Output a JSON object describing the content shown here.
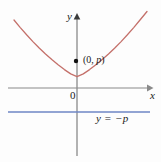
{
  "figure": {
    "background_color": "#fdfdfd",
    "width": 161,
    "height": 162
  },
  "axes": {
    "x_label": "x",
    "y_label": "y",
    "origin_label": "0",
    "axis_color": "#8a8a8a",
    "x_axis": {
      "y_px": 88,
      "x_start_px": 8,
      "x_end_px": 152
    },
    "y_axis": {
      "x_px": 77,
      "y_start_px": 14,
      "y_end_px": 156
    }
  },
  "annotations": {
    "focus": {
      "label_open": "(0, ",
      "label_var": "p",
      "label_close": ")",
      "point_color": "#111111",
      "point_px": {
        "x": 76,
        "y": 61
      }
    },
    "directrix": {
      "label_y": "y",
      "label_eq": " = ",
      "label_neg": "−",
      "label_var": "p",
      "line_color": "#6e86c4",
      "line_y_px": 112,
      "x_start_px": 8,
      "x_end_px": 150
    }
  },
  "chart_data": {
    "type": "line",
    "title": "",
    "xlabel": "x",
    "ylabel": "y",
    "grid": false,
    "legend": null,
    "xlim": [
      -69,
      75
    ],
    "ylim": [
      -68,
      74
    ],
    "series": [
      {
        "name": "parabola",
        "equation": "x^2 = 4py",
        "color": "#c4706a",
        "stroke_width": 1.3,
        "points_px": [
          [
            14.0,
            20.0
          ],
          [
            20.3,
            27.6
          ],
          [
            26.6,
            34.8
          ],
          [
            32.9,
            41.6
          ],
          [
            39.2,
            48.0
          ],
          [
            45.5,
            54.0
          ],
          [
            51.8,
            59.6
          ],
          [
            58.1,
            64.8
          ],
          [
            64.4,
            69.6
          ],
          [
            70.7,
            73.9
          ],
          [
            77.0,
            76.6
          ],
          [
            83.3,
            73.9
          ],
          [
            89.6,
            69.6
          ],
          [
            95.9,
            64.8
          ],
          [
            102.2,
            59.6
          ],
          [
            108.5,
            54.0
          ],
          [
            114.8,
            48.0
          ],
          [
            121.1,
            41.6
          ],
          [
            127.4,
            34.8
          ],
          [
            133.7,
            27.6
          ],
          [
            140.0,
            20.0
          ],
          [
            147.0,
            11.5
          ]
        ]
      },
      {
        "name": "directrix",
        "equation": "y = -p",
        "color": "#6e86c4",
        "stroke_width": 1.6,
        "points_px": [
          [
            8.0,
            112.0
          ],
          [
            150.0,
            112.0
          ]
        ]
      }
    ],
    "markers": [
      {
        "name": "focus",
        "label": "(0, p)",
        "x_px": 76,
        "y_px": 61,
        "color": "#111111"
      }
    ]
  }
}
